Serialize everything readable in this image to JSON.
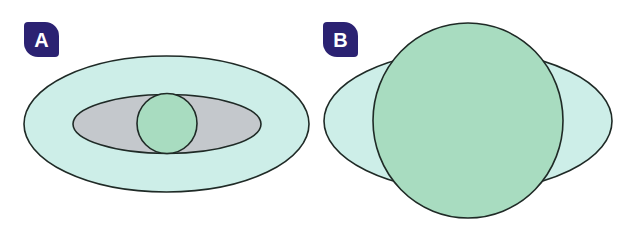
{
  "colors": {
    "badge_bg": "#2b2272",
    "badge_text": "#ffffff",
    "outer_fill": "#cdeee8",
    "middle_fill": "#c4c8cc",
    "core_fill": "#a8dcc0",
    "stroke": "#1f2a26"
  },
  "panels": [
    {
      "label": "A",
      "shapes": [
        {
          "name": "outer-ellipse",
          "cx": 166.5,
          "cy": 124,
          "rx": 142.5,
          "ry": 68,
          "fill": "#cdeee8"
        },
        {
          "name": "middle-ellipse",
          "cx": 167,
          "cy": 124,
          "rx": 94,
          "ry": 29.5,
          "fill": "#c4c8cc"
        },
        {
          "name": "core-circle",
          "cx": 167,
          "cy": 123.5,
          "rx": 30,
          "ry": 30,
          "fill": "#a8dcc0"
        }
      ]
    },
    {
      "label": "B",
      "shapes": [
        {
          "name": "outer-ellipse",
          "cx": 468,
          "cy": 121,
          "rx": 144,
          "ry": 70,
          "fill": "#cdeee8"
        },
        {
          "name": "core-circle",
          "cx": 468,
          "cy": 120.5,
          "rx": 95,
          "ry": 97.5,
          "fill": "#a8dcc0"
        }
      ]
    }
  ]
}
